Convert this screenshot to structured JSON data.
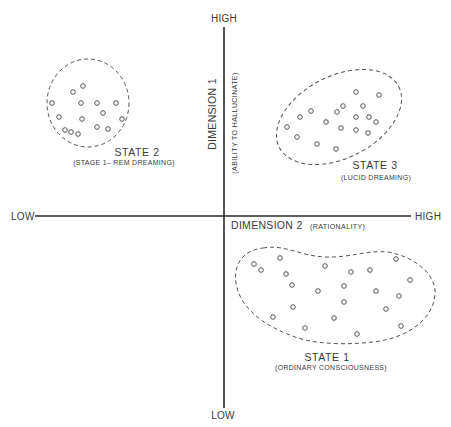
{
  "diagram": {
    "axes": {
      "vertical": {
        "high_label": "HIGH",
        "low_label": "LOW",
        "title": "DIMENSION 1",
        "subtitle": "(ABILITY TO HALLUCINATE)"
      },
      "horizontal": {
        "high_label": "HIGH",
        "low_label": "LOW",
        "title": "DIMENSION 2",
        "subtitle": "(RATIONALITY)"
      }
    },
    "states": [
      {
        "id": "state-1",
        "title": "STATE 1",
        "subtitle": "(ORDINARY CONSCIOUSNESS)",
        "quadrant": "low dimension 1, high dimension 2",
        "point_count": 22
      },
      {
        "id": "state-2",
        "title": "STATE 2",
        "subtitle": "(STAGE 1– REM DREAMING)",
        "quadrant": "high dimension 1, low dimension 2",
        "point_count": 15
      },
      {
        "id": "state-3",
        "title": "STATE 3",
        "subtitle": "(LUCID DREAMING)",
        "quadrant": "high dimension 1, high dimension 2",
        "point_count": 18
      }
    ],
    "colors": {
      "axis": "#2a2a2a",
      "outline": "#555555",
      "text": "#3a3a3a",
      "background": "#ffffff"
    }
  },
  "points": {
    "state_2": [
      [
        73,
        92
      ],
      [
        83,
        86
      ],
      [
        52,
        103
      ],
      [
        81,
        103
      ],
      [
        97,
        103
      ],
      [
        116,
        103
      ],
      [
        59,
        117
      ],
      [
        82,
        119
      ],
      [
        103,
        113
      ],
      [
        122,
        119
      ],
      [
        65,
        130
      ],
      [
        71,
        132
      ],
      [
        78,
        134
      ],
      [
        97,
        127
      ],
      [
        108,
        129
      ]
    ],
    "state_3": [
      [
        356,
        92
      ],
      [
        379,
        95
      ],
      [
        311,
        111
      ],
      [
        343,
        106
      ],
      [
        337,
        112
      ],
      [
        363,
        106
      ],
      [
        300,
        117
      ],
      [
        356,
        117
      ],
      [
        369,
        117
      ],
      [
        376,
        122
      ],
      [
        326,
        122
      ],
      [
        287,
        127
      ],
      [
        341,
        128
      ],
      [
        356,
        130
      ],
      [
        368,
        133
      ],
      [
        297,
        137
      ],
      [
        317,
        144
      ],
      [
        336,
        149
      ]
    ],
    "state_1": [
      [
        254,
        264
      ],
      [
        261,
        270
      ],
      [
        280,
        258
      ],
      [
        286,
        274
      ],
      [
        292,
        285
      ],
      [
        325,
        266
      ],
      [
        351,
        272
      ],
      [
        370,
        270
      ],
      [
        396,
        259
      ],
      [
        410,
        280
      ],
      [
        344,
        286
      ],
      [
        318,
        291
      ],
      [
        376,
        291
      ],
      [
        399,
        296
      ],
      [
        344,
        302
      ],
      [
        293,
        307
      ],
      [
        386,
        309
      ],
      [
        273,
        317
      ],
      [
        334,
        318
      ],
      [
        305,
        328
      ],
      [
        401,
        326
      ],
      [
        357,
        334
      ]
    ]
  }
}
